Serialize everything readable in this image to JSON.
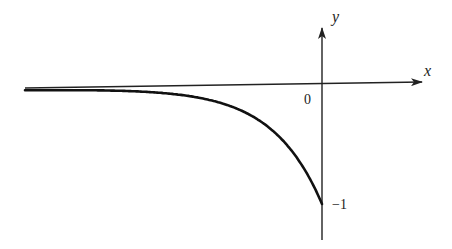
{
  "chart_data": {
    "type": "line",
    "title": "",
    "function": "y = -e^x",
    "xlabel": "x",
    "ylabel": "y",
    "origin_label": "0",
    "y_tick_labels": [
      {
        "value": -1,
        "label": "−1"
      }
    ],
    "xlim": [
      -6,
      2.2
    ],
    "ylim": [
      -1.5,
      0.9
    ],
    "grid": false,
    "legend": "none",
    "series": [
      {
        "name": "curve",
        "x": [
          -6,
          -5,
          -4,
          -3,
          -2.5,
          -2,
          -1.5,
          -1,
          -0.75,
          -0.5,
          -0.25,
          0
        ],
        "y": [
          -0.0025,
          -0.0067,
          -0.0183,
          -0.0498,
          -0.0821,
          -0.1353,
          -0.2231,
          -0.3679,
          -0.4724,
          -0.6065,
          -0.7788,
          -1.0
        ]
      }
    ],
    "colors": {
      "axis": "#222222",
      "curve": "#111111"
    }
  }
}
